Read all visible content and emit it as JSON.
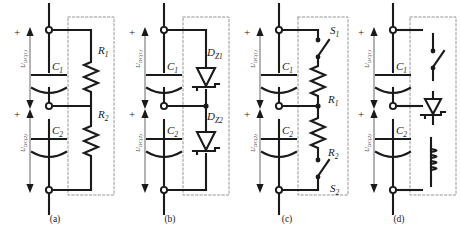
{
  "figure": {
    "type": "circuit-diagram",
    "panel_count": 4,
    "background_color": "#ffffff",
    "line_color": "#1a1a1a",
    "dashed_box_color": "#8a8a8a"
  },
  "panels": [
    {
      "id": "a",
      "caption": "(a)",
      "x": 8,
      "components": [
        {
          "name": "C1",
          "base": "C",
          "sub": "1",
          "type": "capacitor"
        },
        {
          "name": "C2",
          "base": "C",
          "sub": "2",
          "type": "capacitor"
        },
        {
          "name": "R1",
          "base": "R",
          "sub": "1",
          "type": "resistor"
        },
        {
          "name": "R2",
          "base": "R",
          "sub": "2",
          "type": "resistor"
        }
      ],
      "voltages": [
        {
          "base": "U",
          "sub": "DC(1)",
          "polarity": "+"
        },
        {
          "base": "U",
          "sub": "DC(2)",
          "polarity": "+"
        }
      ]
    },
    {
      "id": "b",
      "caption": "(b)",
      "x": 123,
      "components": [
        {
          "name": "C1",
          "base": "C",
          "sub": "1",
          "type": "capacitor"
        },
        {
          "name": "C2",
          "base": "C",
          "sub": "2",
          "type": "capacitor"
        },
        {
          "name": "DZ1",
          "base": "D",
          "sub": "Z1",
          "type": "zener-diode"
        },
        {
          "name": "DZ2",
          "base": "D",
          "sub": "Z2",
          "type": "zener-diode"
        }
      ],
      "voltages": [
        {
          "base": "U",
          "sub": "DC(1)",
          "polarity": "+"
        },
        {
          "base": "U",
          "sub": "DC(2)",
          "polarity": "+"
        }
      ]
    },
    {
      "id": "c",
      "caption": "(c)",
      "x": 238,
      "components": [
        {
          "name": "C1",
          "base": "C",
          "sub": "1",
          "type": "capacitor"
        },
        {
          "name": "C2",
          "base": "C",
          "sub": "2",
          "type": "capacitor"
        },
        {
          "name": "S1",
          "base": "S",
          "sub": "1",
          "type": "switch"
        },
        {
          "name": "R1",
          "base": "R",
          "sub": "1",
          "type": "resistor"
        },
        {
          "name": "R2",
          "base": "R",
          "sub": "2",
          "type": "resistor"
        },
        {
          "name": "S2",
          "base": "S",
          "sub": "2",
          "type": "switch"
        }
      ],
      "voltages": [
        {
          "base": "U",
          "sub": "DC(1)",
          "polarity": "+"
        },
        {
          "base": "U",
          "sub": "DC(2)",
          "polarity": "+"
        }
      ]
    },
    {
      "id": "d",
      "caption": "(d)",
      "x": 352,
      "components": [
        {
          "name": "C1",
          "base": "C",
          "sub": "1",
          "type": "capacitor"
        },
        {
          "name": "C2",
          "base": "C",
          "sub": "2",
          "type": "capacitor"
        },
        {
          "name": "switch",
          "base": "",
          "sub": "",
          "type": "switch"
        },
        {
          "name": "zener",
          "base": "",
          "sub": "",
          "type": "zener-diode"
        },
        {
          "name": "inductor",
          "base": "",
          "sub": "",
          "type": "inductor"
        }
      ],
      "voltages": [
        {
          "base": "U",
          "sub": "DC(1)",
          "polarity": "+"
        },
        {
          "base": "U",
          "sub": "DC(2)",
          "polarity": "+"
        }
      ]
    }
  ]
}
